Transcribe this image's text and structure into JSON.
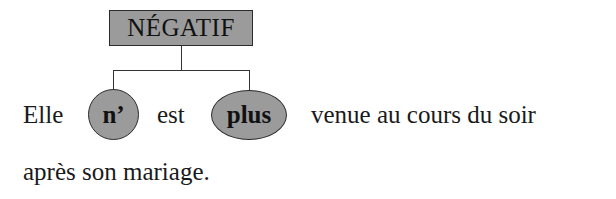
{
  "diagram": {
    "root_label": "NÉGATIF",
    "nodes": [
      {
        "label": "n’"
      },
      {
        "label": "plus"
      }
    ],
    "sentence": {
      "w1": "Elle",
      "w2": "est",
      "w3": "venue au cours du soir",
      "line2": "après son mariage."
    },
    "colors": {
      "fill": "#9b9b9b",
      "stroke": "#2b2b2b"
    }
  }
}
